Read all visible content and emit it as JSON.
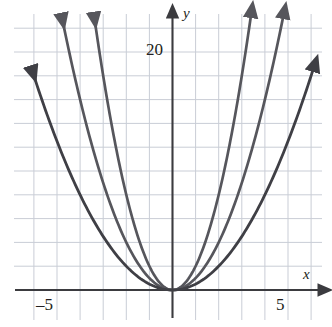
{
  "figure": {
    "type": "math-graph",
    "background": "#ffffff"
  },
  "labels": {
    "y_axis": "y",
    "x_axis": "x",
    "y_tick_20": "20",
    "x_tick_neg5": "–5",
    "x_tick_5": "5"
  },
  "chart_data": {
    "type": "line",
    "title": "",
    "xlabel": "x",
    "ylabel": "y",
    "xlim": [
      -5.6,
      6.0
    ],
    "ylim": [
      -0.6,
      24.0
    ],
    "grid": true,
    "grid_step_x": 1,
    "grid_step_y": 2,
    "grid_color": "#c9cdd6",
    "axis_color": "#3b3b3f",
    "legend": "none",
    "xticks": [
      -5,
      5
    ],
    "xtick_labels": [
      "–5",
      "5"
    ],
    "yticks": [
      20
    ],
    "ytick_labels": [
      "20"
    ],
    "series": [
      {
        "name": "y = 2x^2",
        "coefficient": 2,
        "color": "#56565c",
        "width": 2.7,
        "arrows": "both",
        "x_start": -3.4,
        "x_end": 3.4,
        "points": [
          {
            "x": -3.4,
            "y": 23.1
          },
          {
            "x": -3.0,
            "y": 18.0
          },
          {
            "x": -2.5,
            "y": 12.5
          },
          {
            "x": -2.0,
            "y": 8.0
          },
          {
            "x": -1.5,
            "y": 4.5
          },
          {
            "x": -1.0,
            "y": 2.0
          },
          {
            "x": -0.5,
            "y": 0.5
          },
          {
            "x": 0.0,
            "y": 0.0
          },
          {
            "x": 0.5,
            "y": 0.5
          },
          {
            "x": 1.0,
            "y": 2.0
          },
          {
            "x": 1.5,
            "y": 4.5
          },
          {
            "x": 2.0,
            "y": 8.0
          },
          {
            "x": 2.5,
            "y": 12.5
          },
          {
            "x": 3.0,
            "y": 18.0
          },
          {
            "x": 3.4,
            "y": 23.1
          }
        ]
      },
      {
        "name": "y = x^2",
        "coefficient": 1,
        "color": "#56565c",
        "width": 2.7,
        "arrows": "both",
        "x_start": -4.8,
        "x_end": 4.8,
        "points": [
          {
            "x": -4.8,
            "y": 23.0
          },
          {
            "x": -4.0,
            "y": 16.0
          },
          {
            "x": -3.0,
            "y": 9.0
          },
          {
            "x": -2.0,
            "y": 4.0
          },
          {
            "x": -1.0,
            "y": 1.0
          },
          {
            "x": 0.0,
            "y": 0.0
          },
          {
            "x": 1.0,
            "y": 1.0
          },
          {
            "x": 2.0,
            "y": 4.0
          },
          {
            "x": 3.0,
            "y": 9.0
          },
          {
            "x": 4.0,
            "y": 16.0
          },
          {
            "x": 4.8,
            "y": 23.0
          }
        ]
      },
      {
        "name": "y = 0.5x^2",
        "coefficient": 0.5,
        "color": "#3f3f45",
        "width": 2.8,
        "arrows": "both",
        "x_start": -6.1,
        "x_end": 6.1,
        "points": [
          {
            "x": -6.1,
            "y": 18.6
          },
          {
            "x": -5.0,
            "y": 12.5
          },
          {
            "x": -4.0,
            "y": 8.0
          },
          {
            "x": -3.0,
            "y": 4.5
          },
          {
            "x": -2.0,
            "y": 2.0
          },
          {
            "x": -1.0,
            "y": 0.5
          },
          {
            "x": 0.0,
            "y": 0.0
          },
          {
            "x": 1.0,
            "y": 0.5
          },
          {
            "x": 2.0,
            "y": 2.0
          },
          {
            "x": 3.0,
            "y": 4.5
          },
          {
            "x": 4.0,
            "y": 8.0
          },
          {
            "x": 5.0,
            "y": 12.5
          },
          {
            "x": 6.1,
            "y": 18.6
          }
        ]
      }
    ]
  }
}
